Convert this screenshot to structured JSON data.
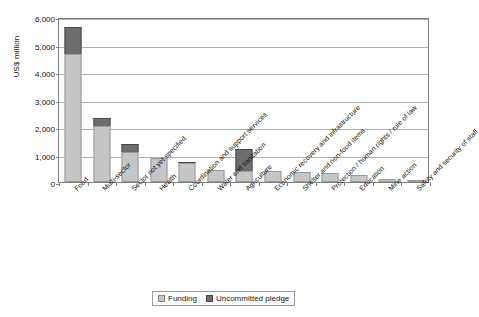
{
  "chart_data": {
    "type": "bar",
    "subtype": "stacked-column",
    "title": "",
    "subtitle": "",
    "xlabel": "",
    "ylabel": "US$ million",
    "ylim": [
      0,
      6000
    ],
    "ytick_interval": 1000,
    "ytick_labels": [
      "6,000",
      "5,000",
      "4,000",
      "3,000",
      "2,000",
      "1,000",
      "0"
    ],
    "ytick_values": [
      6000,
      5000,
      4000,
      3000,
      2000,
      1000,
      0
    ],
    "grid": true,
    "legend_position": "bottom",
    "categories": [
      "Food",
      "Multi-sector",
      "Sector not yet specified",
      "Health",
      "Coordination and support services",
      "Water and sanitation",
      "Agriculture",
      "Economic recovery and infrastructure",
      "Shelter and non-food items",
      "Protection / human rights / rule of law",
      "Education",
      "Mine action",
      "Safety and security of staff"
    ],
    "series": [
      {
        "name": "Funding",
        "color": "#c6c6c6",
        "values": [
          4650,
          2040,
          1090,
          860,
          680,
          430,
          400,
          390,
          370,
          330,
          260,
          120,
          20
        ]
      },
      {
        "name": "Uncommitted pledge",
        "color": "#6e6e6e",
        "values": [
          990,
          290,
          290,
          0,
          40,
          0,
          800,
          0,
          0,
          0,
          0,
          0,
          0
        ]
      }
    ],
    "totals": [
      5640,
      2330,
      1380,
      860,
      720,
      430,
      1200,
      390,
      370,
      330,
      260,
      120,
      20
    ]
  },
  "legend": {
    "items": [
      {
        "label": "Funding",
        "swatch": "funding"
      },
      {
        "label": "Uncommitted pledge",
        "swatch": "pledge"
      }
    ]
  }
}
